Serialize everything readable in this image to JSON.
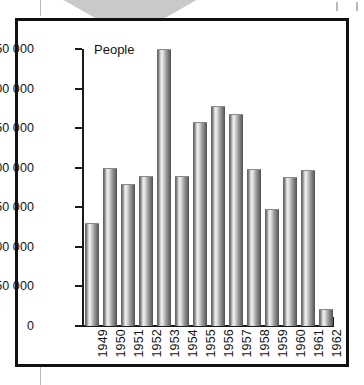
{
  "figure": {
    "frame_border_color": "#111111",
    "background": "#ffffff",
    "decorations": {
      "arrow_shape": "down-triangle",
      "arrow_color": "#c9c9c9",
      "margin_rule_color": "#b8b8b8",
      "corner_tick_color": "#b9b9b9"
    }
  },
  "chart_data": {
    "type": "bar",
    "title": "",
    "subtitle": "",
    "axis_caption": "People",
    "xlabel": "",
    "ylabel": "People",
    "ylim": [
      0,
      350000
    ],
    "ytick_values": [
      0,
      50000,
      100000,
      150000,
      200000,
      250000,
      300000,
      350000
    ],
    "ytick_labels": [
      "0",
      "50 000",
      "100 000",
      "150 000",
      "200 000",
      "250 000",
      "300 000",
      "350 000"
    ],
    "grid": false,
    "legend": false,
    "legend_position": "none",
    "bar_style": "cylindrical-gradient-grayscale",
    "categories": [
      "1949",
      "1950",
      "1951",
      "1952",
      "1953",
      "1954",
      "1955",
      "1956",
      "1957",
      "1958",
      "1959",
      "1960",
      "1961",
      "1962"
    ],
    "values": [
      130000,
      200000,
      180000,
      190000,
      350000,
      190000,
      258000,
      278000,
      268000,
      198000,
      148000,
      188000,
      197000,
      22000
    ],
    "series": [
      {
        "name": "People",
        "values": [
          130000,
          200000,
          180000,
          190000,
          350000,
          190000,
          258000,
          278000,
          268000,
          198000,
          148000,
          188000,
          197000,
          22000
        ]
      }
    ]
  }
}
